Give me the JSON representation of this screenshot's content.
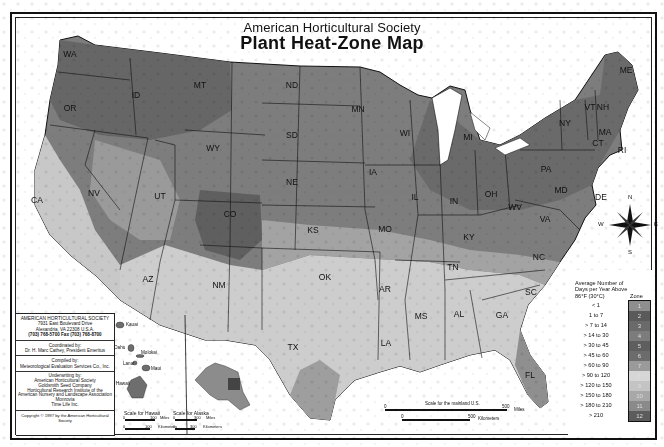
{
  "title": {
    "subtitle": "American Horticultural Society",
    "main": "Plant Heat-Zone Map"
  },
  "states": [
    {
      "abbr": "WA",
      "x": 70,
      "y": 57
    },
    {
      "abbr": "OR",
      "x": 70,
      "y": 111
    },
    {
      "abbr": "CA",
      "x": 37,
      "y": 203
    },
    {
      "abbr": "ID",
      "x": 136,
      "y": 98
    },
    {
      "abbr": "NV",
      "x": 94,
      "y": 196
    },
    {
      "abbr": "MT",
      "x": 200,
      "y": 88
    },
    {
      "abbr": "WY",
      "x": 213,
      "y": 151
    },
    {
      "abbr": "UT",
      "x": 160,
      "y": 199
    },
    {
      "abbr": "CO",
      "x": 230,
      "y": 217
    },
    {
      "abbr": "AZ",
      "x": 148,
      "y": 282
    },
    {
      "abbr": "NM",
      "x": 219,
      "y": 288
    },
    {
      "abbr": "ND",
      "x": 292,
      "y": 88
    },
    {
      "abbr": "SD",
      "x": 292,
      "y": 138
    },
    {
      "abbr": "NE",
      "x": 292,
      "y": 185
    },
    {
      "abbr": "KS",
      "x": 313,
      "y": 233
    },
    {
      "abbr": "OK",
      "x": 325,
      "y": 280
    },
    {
      "abbr": "TX",
      "x": 293,
      "y": 350
    },
    {
      "abbr": "MN",
      "x": 358,
      "y": 112
    },
    {
      "abbr": "IA",
      "x": 373,
      "y": 175
    },
    {
      "abbr": "MO",
      "x": 385,
      "y": 232
    },
    {
      "abbr": "AR",
      "x": 385,
      "y": 292
    },
    {
      "abbr": "LA",
      "x": 386,
      "y": 346
    },
    {
      "abbr": "WI",
      "x": 405,
      "y": 136
    },
    {
      "abbr": "IL",
      "x": 415,
      "y": 200
    },
    {
      "abbr": "MS",
      "x": 421,
      "y": 319
    },
    {
      "abbr": "AL",
      "x": 459,
      "y": 317
    },
    {
      "abbr": "TN",
      "x": 453,
      "y": 270
    },
    {
      "abbr": "KY",
      "x": 469,
      "y": 240
    },
    {
      "abbr": "IN",
      "x": 454,
      "y": 204
    },
    {
      "abbr": "MI",
      "x": 468,
      "y": 140
    },
    {
      "abbr": "OH",
      "x": 491,
      "y": 197
    },
    {
      "abbr": "GA",
      "x": 502,
      "y": 318
    },
    {
      "abbr": "FL",
      "x": 530,
      "y": 378
    },
    {
      "abbr": "SC",
      "x": 531,
      "y": 295
    },
    {
      "abbr": "NC",
      "x": 539,
      "y": 260
    },
    {
      "abbr": "VA",
      "x": 545,
      "y": 222
    },
    {
      "abbr": "WV",
      "x": 515,
      "y": 210
    },
    {
      "abbr": "PA",
      "x": 546,
      "y": 172
    },
    {
      "abbr": "NY",
      "x": 565,
      "y": 126
    },
    {
      "abbr": "VT",
      "x": 590,
      "y": 110
    },
    {
      "abbr": "NH",
      "x": 603,
      "y": 110
    },
    {
      "abbr": "ME",
      "x": 626,
      "y": 73
    },
    {
      "abbr": "MA",
      "x": 605,
      "y": 135
    },
    {
      "abbr": "CT",
      "x": 598,
      "y": 146
    },
    {
      "abbr": "RI",
      "x": 622,
      "y": 153
    },
    {
      "abbr": "DE",
      "x": 601,
      "y": 200
    },
    {
      "abbr": "MD",
      "x": 561,
      "y": 193
    }
  ],
  "compass": {
    "n": "N",
    "s": "S",
    "e": "E",
    "w": "W"
  },
  "info_box": {
    "org": "AMERICAN HORTICULTURAL SOCIETY",
    "address1": "7931 East Boulevard Drive",
    "address2": "Alexandria, VA 22308 U.S.A.",
    "phone": "(703) 768-5700 Fax (703) 768-8700",
    "coordinated_label": "Coordinated by:",
    "coordinator": "Dr. H. Marc Cathey, President Emeritus",
    "compiled_label": "Compiled by:",
    "compiler": "Meteorological Evaluation Services Co., Inc.",
    "underwriting_label": "Underwriting by:",
    "underwriters": [
      "American Horticultural Society",
      "Goldsmith Seed Company",
      "Horticultural Research Institute of the",
      "American Nursery and Landscape Association",
      "Monrovia",
      "Time Life Inc."
    ],
    "copyright": "Copyright © 1997 by the American Horticultural Society"
  },
  "hawaii": {
    "islands": [
      "Kauai",
      "Oahu",
      "Molokai",
      "Lanai",
      "Maui",
      "Hawaii"
    ],
    "scale_title": "Scale for Hawaii",
    "scale_miles": "100",
    "miles_label": "Miles",
    "scale_km": "100",
    "km_label": "Kilometers",
    "zero": "0"
  },
  "alaska": {
    "scale_title": "Scale for Alaska",
    "scale_miles": "300",
    "miles_label": "Miles",
    "scale_km": "300",
    "km_label": "Kilometers",
    "zero": "0"
  },
  "mainland_scale": {
    "title": "Scale for the mainland U.S.",
    "zero": "0",
    "miles": "500",
    "miles_label": "Miles",
    "km": "500",
    "km_label": "Kilometers"
  },
  "legend": {
    "heading": "Average Number of Days per Year Above 86°F (30°C)",
    "zone_label": "Zone",
    "rows": [
      {
        "range": "< 1",
        "zone": "1",
        "color": "#8e8e8e"
      },
      {
        "range": "1 to 7",
        "zone": "2",
        "color": "#5a5a5a"
      },
      {
        "range": "> 7 to 14",
        "zone": "3",
        "color": "#6a6a6a"
      },
      {
        "range": "> 14 to 30",
        "zone": "4",
        "color": "#7c7c7c"
      },
      {
        "range": "> 30 to 45",
        "zone": "5",
        "color": "#5e5e5e"
      },
      {
        "range": "> 45 to 60",
        "zone": "6",
        "color": "#6c6c6c"
      },
      {
        "range": "> 60 to 90",
        "zone": "7",
        "color": "#9a9a9a"
      },
      {
        "range": "> 90 to 120",
        "zone": "8",
        "color": "#d6d6d6"
      },
      {
        "range": "> 120 to 150",
        "zone": "9",
        "color": "#c4c4c4"
      },
      {
        "range": "> 150 to 180",
        "zone": "10",
        "color": "#a8a8a8"
      },
      {
        "range": "> 180 to 210",
        "zone": "11",
        "color": "#8a8a8a"
      },
      {
        "range": "> 210",
        "zone": "12",
        "color": "#5c5c5c"
      }
    ]
  }
}
